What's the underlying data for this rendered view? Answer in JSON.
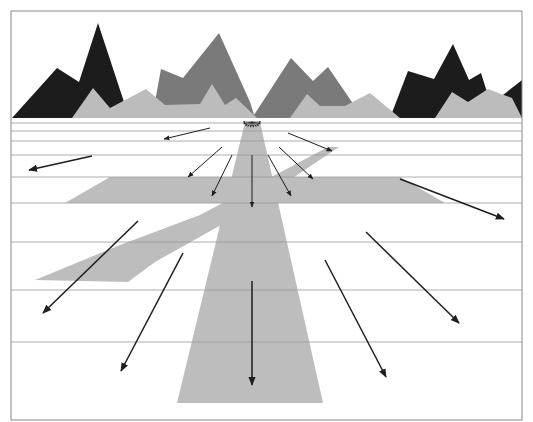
{
  "diagram": {
    "kind": "optical-flow-field",
    "frame": {
      "x": 11,
      "y": 11,
      "width": 511,
      "height": 409,
      "stroke": "#8a8a8a"
    },
    "colors": {
      "background": "#ffffff",
      "mountain_dark": "#1c1c1c",
      "mountain_mid": "#7a7a7a",
      "mountain_light": "#bcbcbc",
      "ground_band": "#bdbdbd",
      "grid_line": "#9a9a9a",
      "arrow": "#1e1e1e"
    },
    "horizon_y": 118,
    "focus_of_expansion": {
      "x": 252,
      "y": 122
    },
    "horizontal_lines_y": [
      123,
      131,
      141,
      155,
      177,
      203,
      242,
      290,
      342
    ],
    "mountains": {
      "dark": [
        "12,118 57,68 79,82 98,23 126,108 124,118",
        "390,118 408,71 434,79 453,44 469,80 481,73 492,108 500,118",
        "494,102 522,80 522,118"
      ],
      "mid": [
        "152,118 161,69 183,78 219,33 250,102 255,118",
        "252,118 291,58 313,81 328,67 356,108 360,118"
      ],
      "light": [
        "72,118 93,88 110,108 146,89 165,105 200,104 212,84 225,105 236,98 257,118",
        "290,118 307,94 320,106 345,106 370,93 400,118",
        "435,118 452,92 468,102 488,89 512,98 522,118"
      ]
    },
    "ground_shapes": {
      "road": "245,122 260,122 323,403 177,403",
      "horizontal_band": "110,177 400,177 445,203 65,203",
      "diagonal_band": "328,147 339,147 230,220 155,262 128,282 82,281 35,280 120,245 200,215"
    },
    "flow_arrows": [
      {
        "x1": 210,
        "y1": 128,
        "x2": 164,
        "y2": 139,
        "w": 1
      },
      {
        "x1": 288,
        "y1": 133,
        "x2": 332,
        "y2": 151,
        "w": 1
      },
      {
        "x1": 92,
        "y1": 156,
        "x2": 29,
        "y2": 170,
        "w": 1.5
      },
      {
        "x1": 222,
        "y1": 147,
        "x2": 188,
        "y2": 177,
        "w": 1
      },
      {
        "x1": 232,
        "y1": 155,
        "x2": 212,
        "y2": 196,
        "w": 1
      },
      {
        "x1": 252,
        "y1": 155,
        "x2": 252,
        "y2": 207,
        "w": 1
      },
      {
        "x1": 268,
        "y1": 155,
        "x2": 291,
        "y2": 196,
        "w": 1
      },
      {
        "x1": 279,
        "y1": 147,
        "x2": 313,
        "y2": 179,
        "w": 1
      },
      {
        "x1": 400,
        "y1": 179,
        "x2": 504,
        "y2": 219,
        "w": 1.5
      },
      {
        "x1": 138,
        "y1": 221,
        "x2": 43,
        "y2": 313,
        "w": 1.5
      },
      {
        "x1": 183,
        "y1": 253,
        "x2": 121,
        "y2": 371,
        "w": 1.5
      },
      {
        "x1": 252,
        "y1": 281,
        "x2": 252,
        "y2": 385,
        "w": 1.5
      },
      {
        "x1": 325,
        "y1": 260,
        "x2": 386,
        "y2": 377,
        "w": 1.5
      },
      {
        "x1": 366,
        "y1": 232,
        "x2": 459,
        "y2": 323,
        "w": 1.5
      }
    ],
    "foe_fan": {
      "radius": 9,
      "angles_deg": [
        180,
        160,
        140,
        120,
        100,
        80,
        60,
        40,
        20,
        0
      ]
    }
  }
}
